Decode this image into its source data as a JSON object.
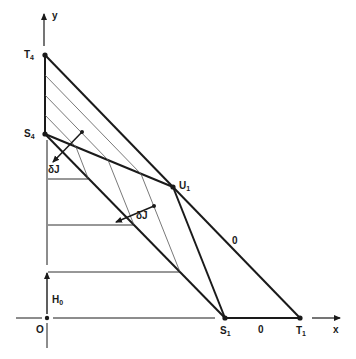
{
  "diagram": {
    "axes": {
      "x_label": "x",
      "y_label": "y",
      "origin_label": "O"
    },
    "points": {
      "T4": {
        "label": "T",
        "sub": "4",
        "x": 45,
        "y": 55
      },
      "S4": {
        "label": "S",
        "sub": "4",
        "x": 45,
        "y": 134
      },
      "U1": {
        "label": "U",
        "sub": "1",
        "x": 173,
        "y": 187
      },
      "S1": {
        "label": "S",
        "sub": "1",
        "x": 225,
        "y": 318
      },
      "T1": {
        "label": "T",
        "sub": "1",
        "x": 300,
        "y": 318
      },
      "O": {
        "label": "O",
        "x": 47,
        "y": 318
      }
    },
    "labels": {
      "deltaJ_1": "δJ",
      "deltaJ_2": "δJ",
      "H0": {
        "label": "H",
        "sub": "0"
      },
      "zero_on_T4T1": "0",
      "zero_on_S1T1": "0"
    },
    "colors": {
      "ink": "#1a1a1a",
      "hatch": "#555555",
      "background": "#ffffff"
    }
  }
}
